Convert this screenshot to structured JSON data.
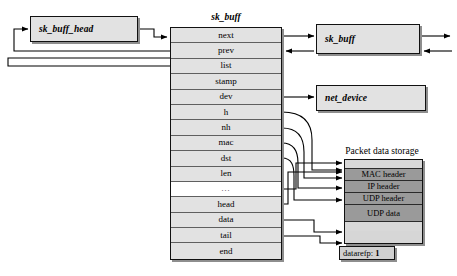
{
  "diagram": {
    "colors": {
      "box_fill": "#e2e2e2",
      "header_fill": "#9a9a9a",
      "pad_fill": "#d8d8d8",
      "border": "#111111",
      "shadow": "#8e8e8e",
      "line": "#000000"
    }
  },
  "sk_buff_head": {
    "label": "sk_buff_head"
  },
  "sk_buff": {
    "title": "sk_buff",
    "fields": [
      {
        "name": "next",
        "blank": false
      },
      {
        "name": "prev",
        "blank": false
      },
      {
        "name": "list",
        "blank": false
      },
      {
        "name": "stamp",
        "blank": false
      },
      {
        "name": "dev",
        "blank": false
      },
      {
        "name": "h",
        "blank": false
      },
      {
        "name": "nh",
        "blank": false
      },
      {
        "name": "mac",
        "blank": false
      },
      {
        "name": "dst",
        "blank": false
      },
      {
        "name": "len",
        "blank": false
      },
      {
        "name": "...",
        "blank": true
      },
      {
        "name": "head",
        "blank": false
      },
      {
        "name": "data",
        "blank": false
      },
      {
        "name": "tail",
        "blank": false
      },
      {
        "name": "end",
        "blank": false
      }
    ]
  },
  "sk_buff_next": {
    "label": "sk_buff"
  },
  "net_device": {
    "label": "net_device"
  },
  "packet_data_storage": {
    "title": "Packet data storage",
    "rows": [
      {
        "label": "",
        "kind": "pad"
      },
      {
        "label": "MAC header",
        "kind": "header"
      },
      {
        "label": "IP header",
        "kind": "header"
      },
      {
        "label": "UDP header",
        "kind": "header"
      },
      {
        "label": "UDP data",
        "kind": "udp-data"
      },
      {
        "label": "",
        "kind": "pad"
      }
    ]
  },
  "datarefp": {
    "label": "datarefp:",
    "value": "1"
  }
}
